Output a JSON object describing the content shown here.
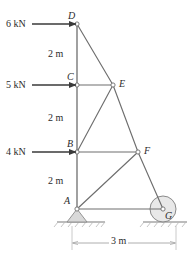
{
  "figure": {
    "type": "statics-truss-diagram",
    "geometry": {
      "joints": {
        "A": {
          "x": 77,
          "y": 209
        },
        "B": {
          "x": 77,
          "y": 152
        },
        "C": {
          "x": 77,
          "y": 85
        },
        "D": {
          "x": 77,
          "y": 24
        },
        "E": {
          "x": 113,
          "y": 85
        },
        "F": {
          "x": 138,
          "y": 152
        },
        "G": {
          "x": 163,
          "y": 209
        }
      },
      "members": [
        [
          "D",
          "C"
        ],
        [
          "C",
          "B"
        ],
        [
          "B",
          "A"
        ],
        [
          "D",
          "E"
        ],
        [
          "C",
          "E"
        ],
        [
          "B",
          "E"
        ],
        [
          "E",
          "F"
        ],
        [
          "B",
          "F"
        ],
        [
          "A",
          "F"
        ],
        [
          "F",
          "G"
        ],
        [
          "A",
          "G"
        ]
      ],
      "ground_y": 222
    },
    "joint_labels": [
      {
        "id": "D",
        "text": "D",
        "x": 68,
        "y": 11
      },
      {
        "id": "C",
        "text": "C",
        "x": 67,
        "y": 72
      },
      {
        "id": "B",
        "text": "B",
        "x": 67,
        "y": 139
      },
      {
        "id": "A",
        "text": "A",
        "x": 64,
        "y": 196
      },
      {
        "id": "E",
        "text": "E",
        "x": 119,
        "y": 79
      },
      {
        "id": "F",
        "text": "F",
        "x": 144,
        "y": 146
      },
      {
        "id": "G",
        "text": "G",
        "x": 165,
        "y": 211
      }
    ],
    "loads": [
      {
        "id": "load-D",
        "label": "6 kN",
        "magnitude": 6,
        "unit": "kN",
        "direction": "right",
        "at_joint": "D",
        "label_x": 6,
        "label_y": 19,
        "arrow_x1": 32,
        "arrow_x2": 76,
        "arrow_y": 24
      },
      {
        "id": "load-C",
        "label": "5 kN",
        "magnitude": 5,
        "unit": "kN",
        "direction": "right",
        "at_joint": "C",
        "label_x": 6,
        "label_y": 80,
        "arrow_x1": 32,
        "arrow_x2": 76,
        "arrow_y": 85
      },
      {
        "id": "load-B",
        "label": "4 kN",
        "magnitude": 4,
        "unit": "kN",
        "direction": "right",
        "at_joint": "B",
        "label_x": 6,
        "label_y": 147,
        "arrow_x1": 32,
        "arrow_x2": 76,
        "arrow_y": 152
      }
    ],
    "vertical_dimensions": [
      {
        "id": "dim-DC",
        "label": "2 m",
        "value": 2,
        "unit": "m",
        "x": 46,
        "y": 49
      },
      {
        "id": "dim-CB",
        "label": "2 m",
        "value": 2,
        "unit": "m",
        "x": 46,
        "y": 113
      },
      {
        "id": "dim-BA",
        "label": "2 m",
        "value": 2,
        "unit": "m",
        "x": 46,
        "y": 176
      }
    ],
    "horizontal_dimension": {
      "id": "dim-AG",
      "label": "3 m",
      "value": 3,
      "unit": "m",
      "x1": 72,
      "x2": 176,
      "y": 243,
      "label_x": 109,
      "label_y": 238
    },
    "supports": [
      {
        "id": "support-A",
        "kind": "pin",
        "at_joint": "A"
      },
      {
        "id": "support-G",
        "kind": "roller",
        "at_joint": "G"
      }
    ],
    "colors": {
      "member": "#6e6e6e",
      "arrow": "#3a3a3a",
      "text": "#2b2b2b",
      "dimension": "#9a9a9a",
      "ground": "#7a7a7a",
      "support_fill": "#d9d9d9"
    }
  }
}
